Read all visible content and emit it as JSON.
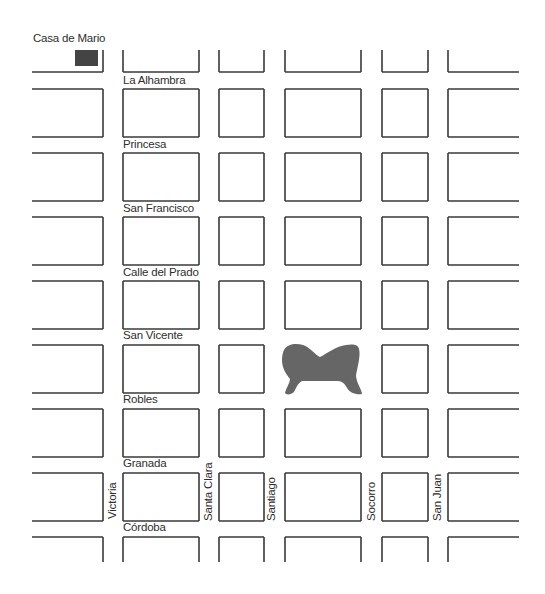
{
  "map": {
    "colors": {
      "background": "#ffffff",
      "block_outline": "#3a3a3a",
      "label": "#2e2e2e",
      "park_fill": "#666666",
      "house_fill": "#444444"
    },
    "landmarks": {
      "home_label": "Casa de Mario",
      "home_marker": {
        "x": 75,
        "y": 50,
        "w": 23,
        "h": 16
      },
      "park": "plaza"
    },
    "columns": [
      {
        "x1": 32,
        "x2": 103,
        "open_left": true
      },
      {
        "x1": 123,
        "x2": 199
      },
      {
        "x1": 219,
        "x2": 264
      },
      {
        "x1": 285,
        "x2": 361
      },
      {
        "x1": 382,
        "x2": 428
      },
      {
        "x1": 448,
        "x2": 519,
        "open_right": true
      }
    ],
    "rows": [
      {
        "y1": 50,
        "y2": 72,
        "open_top": true
      },
      {
        "y1": 89,
        "y2": 137
      },
      {
        "y1": 153,
        "y2": 201
      },
      {
        "y1": 217,
        "y2": 265
      },
      {
        "y1": 281,
        "y2": 329
      },
      {
        "y1": 345,
        "y2": 393
      },
      {
        "y1": 409,
        "y2": 457
      },
      {
        "y1": 473,
        "y2": 521
      },
      {
        "y1": 537,
        "y2": 562,
        "open_bottom": true
      }
    ],
    "horizontal_streets": [
      {
        "name": "La Alhambra",
        "x": 123,
        "y": 84
      },
      {
        "name": "Princesa",
        "x": 123,
        "y": 148
      },
      {
        "name": "San Francisco",
        "x": 123,
        "y": 212
      },
      {
        "name": "Calle del Prado",
        "x": 123,
        "y": 276
      },
      {
        "name": "San Vicente",
        "x": 123,
        "y": 339
      },
      {
        "name": "Robles",
        "x": 123,
        "y": 403
      },
      {
        "name": "Granada",
        "x": 123,
        "y": 467
      },
      {
        "name": "Córdoba",
        "x": 123,
        "y": 531
      }
    ],
    "vertical_streets": [
      {
        "name": "Victoria",
        "x": 116,
        "y": 519
      },
      {
        "name": "Santa Clara",
        "x": 212,
        "y": 521
      },
      {
        "name": "Santiago",
        "x": 275,
        "y": 521
      },
      {
        "name": "Socorro",
        "x": 375,
        "y": 521
      },
      {
        "name": "San Juan",
        "x": 441,
        "y": 521
      }
    ]
  }
}
